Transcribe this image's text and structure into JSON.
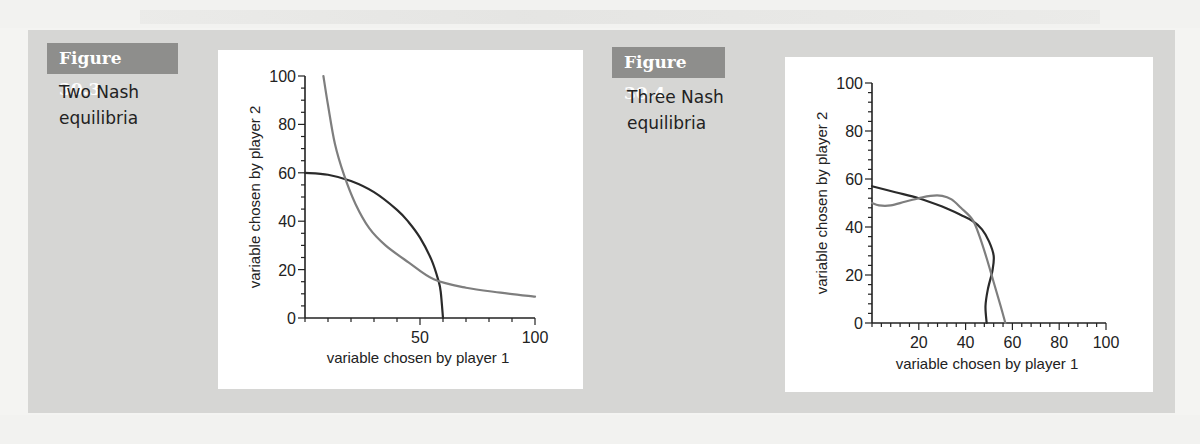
{
  "figures": [
    {
      "label": "Figure 30.3",
      "caption_lines": [
        "Two Nash",
        "equilibria"
      ]
    },
    {
      "label": "Figure 30.4",
      "caption_lines": [
        "Three Nash",
        "equilibria"
      ]
    }
  ],
  "chart_data": [
    {
      "type": "line",
      "title": "Two Nash equilibria",
      "xlabel": "variable chosen by player 1",
      "ylabel": "variable chosen by player 2",
      "xlim": [
        0,
        100
      ],
      "ylim": [
        0,
        100
      ],
      "xticks": [
        50,
        100
      ],
      "yticks": [
        0,
        20,
        40,
        60,
        80,
        100
      ],
      "x_minor_step": 10,
      "y_minor_step": 5,
      "grid": false,
      "series": [
        {
          "name": "dark-curve",
          "color": "#2a2a2a",
          "points": [
            [
              0,
              60
            ],
            [
              10,
              59.2
            ],
            [
              20,
              56.6
            ],
            [
              30,
              52
            ],
            [
              40,
              44.7
            ],
            [
              45,
              39.7
            ],
            [
              50,
              33.2
            ],
            [
              55,
              24
            ],
            [
              58,
              15.5
            ],
            [
              59,
              10.9
            ],
            [
              60,
              0
            ]
          ]
        },
        {
          "name": "light-curve",
          "color": "#7e7e7e",
          "points": [
            [
              8,
              100
            ],
            [
              10,
              88
            ],
            [
              13,
              72
            ],
            [
              17,
              59
            ],
            [
              22,
              47
            ],
            [
              28,
              37
            ],
            [
              35,
              30
            ],
            [
              45,
              23
            ],
            [
              56,
              16
            ],
            [
              70,
              12.5
            ],
            [
              85,
              10.5
            ],
            [
              100,
              8.8
            ]
          ]
        }
      ],
      "equilibria": [
        [
          18,
          57
        ],
        [
          57,
          16
        ]
      ]
    },
    {
      "type": "line",
      "title": "Three Nash equilibria",
      "xlabel": "variable chosen by player 1",
      "ylabel": "variable chosen by player 2",
      "xlim": [
        0,
        100
      ],
      "ylim": [
        0,
        100
      ],
      "xticks": [
        20,
        40,
        60,
        80,
        100
      ],
      "yticks": [
        0,
        20,
        40,
        60,
        80,
        100
      ],
      "x_minor_step": 4,
      "y_minor_step": 4,
      "grid": false,
      "series": [
        {
          "name": "dark-curve",
          "color": "#2a2a2a",
          "points": [
            [
              0,
              57
            ],
            [
              10,
              54.5
            ],
            [
              20,
              52
            ],
            [
              30,
              48.5
            ],
            [
              38,
              45
            ],
            [
              43,
              42.5
            ],
            [
              47,
              39
            ],
            [
              50,
              34
            ],
            [
              52,
              28
            ],
            [
              51.5,
              22
            ],
            [
              49.5,
              14
            ],
            [
              48.5,
              7
            ],
            [
              49,
              0
            ]
          ]
        },
        {
          "name": "light-curve",
          "color": "#7e7e7e",
          "points": [
            [
              0,
              50
            ],
            [
              3,
              49
            ],
            [
              8,
              49
            ],
            [
              14,
              50.5
            ],
            [
              20,
              52
            ],
            [
              25,
              53
            ],
            [
              30,
              53
            ],
            [
              34,
              51.5
            ],
            [
              38,
              48
            ],
            [
              43,
              43
            ],
            [
              46,
              36
            ],
            [
              49,
              27
            ],
            [
              52,
              17
            ],
            [
              55,
              7
            ],
            [
              57,
              0
            ]
          ]
        }
      ],
      "equilibria": [
        [
          20,
          52
        ],
        [
          43,
          43
        ],
        [
          51,
          18
        ]
      ]
    }
  ]
}
